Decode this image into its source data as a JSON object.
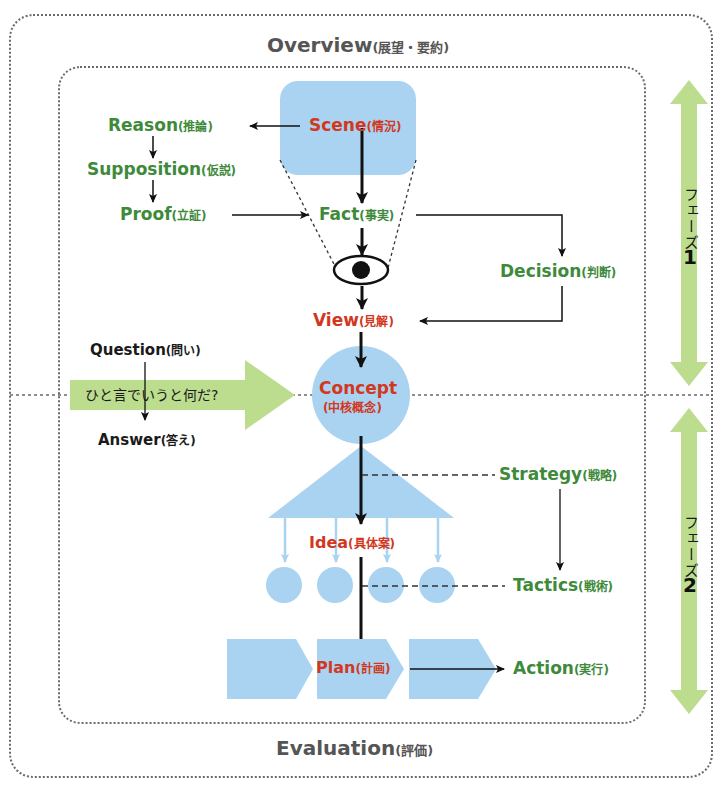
{
  "outer_frame": {
    "title": "Overview",
    "title_jp": "(展望・要約)",
    "footer": "Evaluation",
    "footer_jp": "(評価)"
  },
  "phases": [
    {
      "label": "フェーズ",
      "number": "1"
    },
    {
      "label": "フェーズ",
      "number": "2"
    }
  ],
  "nodes": {
    "scene": {
      "en": "Scene",
      "jp": "(情況)"
    },
    "reason": {
      "en": "Reason",
      "jp": "(推論)"
    },
    "supposition": {
      "en": "Supposition",
      "jp": "(仮説)"
    },
    "proof": {
      "en": "Proof",
      "jp": "(立証)"
    },
    "fact": {
      "en": "Fact",
      "jp": "(事実)"
    },
    "decision": {
      "en": "Decision",
      "jp": "(判断)"
    },
    "view": {
      "en": "View",
      "jp": "(見解)"
    },
    "question": {
      "en": "Question",
      "jp": "(問い)"
    },
    "banner": {
      "text": "ひと言でいうと何だ?"
    },
    "answer": {
      "en": "Answer",
      "jp": "(答え)"
    },
    "concept": {
      "en": "Concept",
      "jp": "(中核概念)"
    },
    "strategy": {
      "en": "Strategy",
      "jp": "(戦略)"
    },
    "idea": {
      "en": "Idea",
      "jp": "(具体案)"
    },
    "tactics": {
      "en": "Tactics",
      "jp": "(戦術)"
    },
    "plan": {
      "en": "Plan",
      "jp": "(計画)"
    },
    "action": {
      "en": "Action",
      "jp": "(実行)"
    }
  },
  "colors": {
    "shape_blue": "#a9d3f1",
    "arrow_green": "#bcdc8e",
    "text_green": "#3e8a3a",
    "text_red": "#d2381e",
    "frame_gray": "#6a6a6a"
  }
}
